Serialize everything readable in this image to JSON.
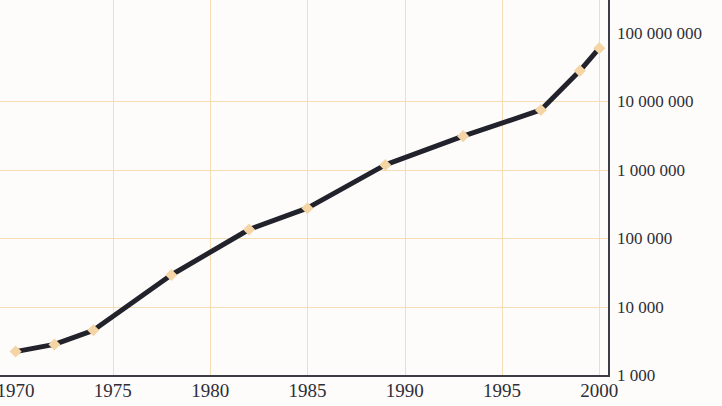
{
  "chart_data": {
    "type": "line",
    "title": "",
    "subtitle": "",
    "xlabel": "",
    "ylabel": "",
    "yscale": "log",
    "xlim": [
      1969,
      2001
    ],
    "ylim": [
      1000,
      100000000
    ],
    "grid": true,
    "legend": null,
    "legend_position": "none",
    "y_tick_labels": [
      "1 000",
      "10 000",
      "100 000",
      "1 000 000",
      "10 000 000",
      "100 000 000"
    ],
    "y_tick_values": [
      1000,
      10000,
      100000,
      1000000,
      10000000,
      100000000
    ],
    "x_tick_labels": [
      "1970",
      "1975",
      "1980",
      "1985",
      "1990",
      "1995",
      "2000"
    ],
    "x_tick_values": [
      1970,
      1975,
      1980,
      1985,
      1990,
      1995,
      2000
    ],
    "series": [
      {
        "name": "",
        "marker": "diamond",
        "marker_color": "#f5d5a5",
        "line_color": "#22222c",
        "x": [
          1970,
          1972,
          1974,
          1978,
          1982,
          1985,
          1989,
          1993,
          1997,
          1999,
          2000
        ],
        "values": [
          2200,
          2800,
          4500,
          29000,
          134000,
          275000,
          1180000,
          3100000,
          7500000,
          28000000,
          60000000
        ]
      }
    ]
  },
  "colors": {
    "background": "#fdfcfa",
    "gridline": "#f3d7a9",
    "axis": "#3c3c46",
    "line": "#22222c",
    "marker": "#f5d5a5",
    "text": "#2e2e38"
  }
}
